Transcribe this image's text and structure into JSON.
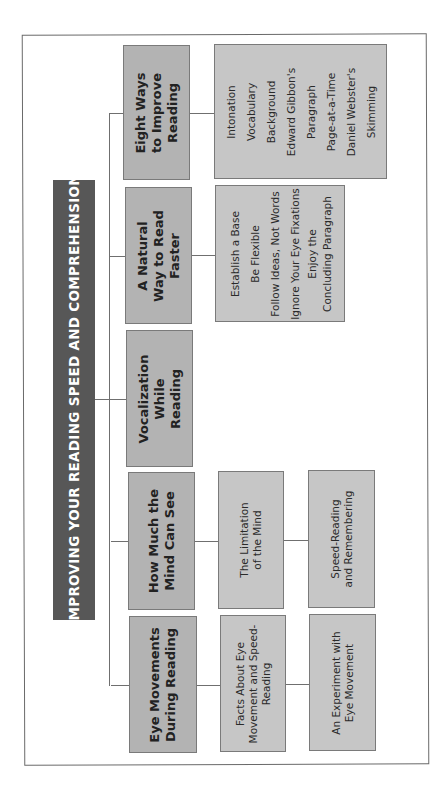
{
  "title": "IMPROVING YOUR READING SPEED AND COMPREHENSION",
  "colors": {
    "title_bar": "#575757",
    "main_box": "#b3b3b3",
    "sub_box": "#c6c6c6",
    "connector": "#6f6f6f"
  },
  "orientation": "rotated 90deg counter-clockwise",
  "branches": [
    {
      "label_lines": [
        "Eye Movements",
        "During Reading"
      ],
      "children": [
        {
          "label_lines": [
            "Facts About Eye",
            "Movement and Speed-",
            "Reading"
          ]
        },
        {
          "label_lines": [
            "An Experiment with",
            "Eye Movement"
          ]
        }
      ]
    },
    {
      "label_lines": [
        "How Much the",
        "Mind Can See"
      ],
      "children": [
        {
          "label_lines": [
            "The Limitation",
            "of the Mind"
          ]
        },
        {
          "label_lines": [
            "Speed-Reading",
            "and Remembering"
          ]
        }
      ]
    },
    {
      "label_lines": [
        "Vocalization",
        "While",
        "Reading"
      ],
      "children": []
    },
    {
      "label_lines": [
        "A Natural",
        "Way to Read",
        "Faster"
      ],
      "children": [
        {
          "label_lines": [
            "Establish a Base",
            "Be Flexible",
            "Follow Ideas, Not Words",
            "Ignore Your Eye Fixations",
            "Enjoy the",
            "Concluding Paragraph"
          ]
        }
      ]
    },
    {
      "label_lines": [
        "Eight Ways",
        "to Improve",
        "Reading"
      ],
      "children": [
        {
          "label_lines": [
            "Intonation",
            "Vocabulary",
            "Background",
            "Edward Gibbon's",
            "Paragraph",
            "Page-at-a-Time",
            "Daniel Webster's",
            "Skimming"
          ]
        }
      ]
    }
  ]
}
